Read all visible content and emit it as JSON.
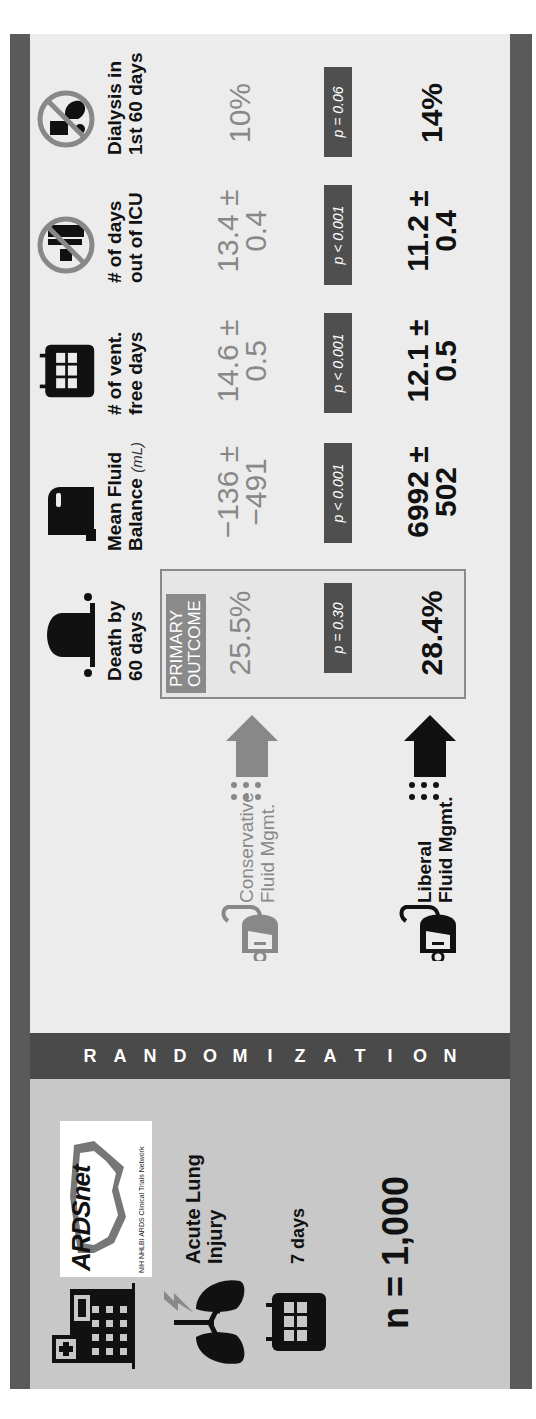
{
  "study": {
    "network_logo_text": "ARDSnet",
    "network_logo_subtitle": "NIH NHLBI ARDS Clinical Trials Network",
    "condition_line1": "Acute Lung",
    "condition_line2": "Injury",
    "duration": "7 days",
    "sample_size": "n = 1,000",
    "icons": [
      "hospital-icon",
      "lungs-icon",
      "calendar-icon"
    ]
  },
  "randomization": {
    "letters": [
      "R",
      "A",
      "N",
      "D",
      "O",
      "M",
      "I",
      "Z",
      "A",
      "T",
      "I",
      "O",
      "N"
    ]
  },
  "groups": [
    {
      "id": "conservative",
      "line1": "Conservative",
      "line2": "Fluid Mgmt.",
      "color": "#888888"
    },
    {
      "id": "liberal",
      "line1": "Liberal",
      "line2": "Fluid Mgmt.",
      "color": "#111111"
    }
  ],
  "outcomes": [
    {
      "id": "death",
      "label_line1": "Death by",
      "label_line2": "60 days",
      "unit": "",
      "icon": "tombstone-icon",
      "conservative": "25.5%",
      "conservative_sd": "",
      "liberal": "28.4%",
      "liberal_sd": "",
      "p_value": "p = 0.30",
      "primary": true
    },
    {
      "id": "fluid_balance",
      "label_line1": "Mean Fluid",
      "label_line2": "Balance",
      "unit": "(mL)",
      "icon": "fluid-container-icon",
      "conservative": "−136 ±",
      "conservative_sd": "−491",
      "liberal": "6992 ±",
      "liberal_sd": "502",
      "p_value": "p < 0.001",
      "primary": false
    },
    {
      "id": "vent_free",
      "label_line1": "# of vent.",
      "label_line2": "free days",
      "unit": "",
      "icon": "calendar-icon",
      "conservative": "14.6 ±",
      "conservative_sd": "0.5",
      "liberal": "12.1 ±",
      "liberal_sd": "0.5",
      "p_value": "p < 0.001",
      "primary": false
    },
    {
      "id": "icu_free",
      "label_line1": "# of days",
      "label_line2": "out of ICU",
      "unit": "",
      "icon": "no-icu-icon",
      "conservative": "13.4 ±",
      "conservative_sd": "0.4",
      "liberal": "11.2 ±",
      "liberal_sd": "0.4",
      "p_value": "p < 0.001",
      "primary": false
    },
    {
      "id": "dialysis",
      "label_line1": "Dialysis in",
      "label_line2": "1st 60 days",
      "unit": "",
      "icon": "no-dialysis-icon",
      "conservative": "10%",
      "conservative_sd": "",
      "liberal": "14%",
      "liberal_sd": "",
      "p_value": "p = 0.06",
      "primary": false
    }
  ],
  "primary_outcome_tag": {
    "line1": "PRIMARY",
    "line2": "OUTCOME"
  },
  "colors": {
    "frame": "#5a5a5a",
    "left_panel": "#c8c8c8",
    "right_panel": "#ececec",
    "badge": "#4f4f4f",
    "conservative": "#888888",
    "liberal": "#111111"
  }
}
